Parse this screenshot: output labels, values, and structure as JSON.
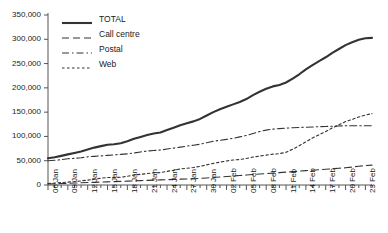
{
  "chart_data": {
    "type": "line",
    "title": "",
    "xlabel": "",
    "ylabel": "",
    "ylim": [
      0,
      350000
    ],
    "grid": false,
    "legend_position": "top-left",
    "y_ticks": [
      "0",
      "50,000",
      "100,000",
      "150,000",
      "200,000",
      "250,000",
      "300,000",
      "350,000"
    ],
    "y_tick_values": [
      0,
      50000,
      100000,
      150000,
      200000,
      250000,
      300000,
      350000
    ],
    "x_tick_labels": [
      "06 Jan",
      "09 Jan",
      "12 Jan",
      "15 Jan",
      "18 Jan",
      "21 Jan",
      "24 Jan",
      "27 Jan",
      "30 Jan",
      "02 Feb",
      "05 Feb",
      "08 Feb",
      "11 Feb",
      "14 Feb",
      "17 Feb",
      "20 Feb",
      "23 Feb"
    ],
    "x": [
      "06 Jan",
      "07 Jan",
      "08 Jan",
      "09 Jan",
      "10 Jan",
      "11 Jan",
      "12 Jan",
      "13 Jan",
      "14 Jan",
      "15 Jan",
      "16 Jan",
      "17 Jan",
      "18 Jan",
      "19 Jan",
      "20 Jan",
      "21 Jan",
      "22 Jan",
      "23 Jan",
      "24 Jan",
      "25 Jan",
      "26 Jan",
      "27 Jan",
      "28 Jan",
      "29 Jan",
      "30 Jan",
      "31 Jan",
      "01 Feb",
      "02 Feb",
      "03 Feb",
      "04 Feb",
      "05 Feb",
      "06 Feb",
      "07 Feb",
      "08 Feb",
      "09 Feb",
      "10 Feb",
      "11 Feb",
      "12 Feb",
      "13 Feb",
      "14 Feb",
      "15 Feb",
      "16 Feb",
      "17 Feb",
      "18 Feb",
      "19 Feb",
      "20 Feb",
      "21 Feb",
      "22 Feb",
      "23 Feb",
      "24 Feb"
    ],
    "series": [
      {
        "name": "TOTAL",
        "style": "solid",
        "width": 2.1,
        "color": "#333333",
        "values": [
          55000,
          57000,
          60000,
          63000,
          66000,
          69000,
          73000,
          77000,
          80000,
          83000,
          84000,
          86000,
          90000,
          95000,
          99000,
          103000,
          106000,
          108000,
          113000,
          118000,
          123000,
          127000,
          131000,
          136000,
          143000,
          150000,
          156000,
          161000,
          166000,
          171000,
          177000,
          185000,
          192000,
          198000,
          203000,
          206000,
          211000,
          219000,
          228000,
          238000,
          247000,
          255000,
          263000,
          272000,
          280000,
          288000,
          294000,
          299000,
          302000,
          303000
        ]
      },
      {
        "name": "Call centre",
        "style": "dashed-long",
        "width": 1.1,
        "color": "#333333",
        "values": [
          2000,
          2500,
          3000,
          3500,
          4000,
          4500,
          5000,
          5500,
          6000,
          6500,
          7000,
          7500,
          8000,
          8500,
          9000,
          9500,
          10000,
          10500,
          11000,
          11500,
          12000,
          12500,
          13000,
          13500,
          14500,
          15500,
          16500,
          17500,
          18500,
          19500,
          20500,
          21500,
          22500,
          23500,
          24500,
          25500,
          26500,
          27500,
          28500,
          29500,
          30500,
          31500,
          32500,
          33500,
          34500,
          35500,
          37000,
          38500,
          40000,
          41000
        ]
      },
      {
        "name": "Postal",
        "style": "dash-dot",
        "width": 1.1,
        "color": "#333333",
        "values": [
          50000,
          51000,
          52000,
          54000,
          55000,
          56000,
          58000,
          59000,
          60000,
          61000,
          62000,
          63000,
          64000,
          66000,
          68000,
          70000,
          71000,
          72000,
          74000,
          76000,
          78000,
          80000,
          82000,
          84000,
          87000,
          90000,
          92000,
          94000,
          96000,
          99000,
          102000,
          106000,
          110000,
          113000,
          115000,
          116000,
          117000,
          118000,
          118500,
          119000,
          119500,
          120000,
          120500,
          121000,
          121500,
          122000,
          122000,
          122000,
          122000,
          122000
        ]
      },
      {
        "name": "Web",
        "style": "dashed-short",
        "width": 1.1,
        "color": "#333333",
        "values": [
          3000,
          4000,
          5000,
          6000,
          7000,
          8500,
          10000,
          12000,
          14000,
          15500,
          15500,
          16000,
          18000,
          20500,
          22000,
          23500,
          25000,
          25500,
          28000,
          30500,
          33000,
          34500,
          36000,
          38500,
          41500,
          44500,
          47000,
          49500,
          51500,
          52500,
          54500,
          57500,
          59500,
          61500,
          63500,
          64500,
          67500,
          73500,
          81000,
          89000,
          97000,
          103500,
          110000,
          117500,
          124000,
          130500,
          135000,
          140000,
          144000,
          147000
        ]
      }
    ]
  }
}
